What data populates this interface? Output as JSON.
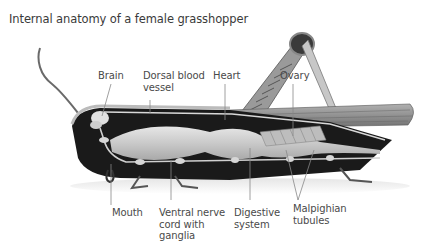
{
  "title": "Internal anatomy of a female grasshopper",
  "labels": {
    "top": [
      {
        "id": "brain",
        "text": "Brain"
      },
      {
        "id": "dorsal_blood_vessel",
        "line1": "Dorsal blood",
        "line2": "vessel"
      },
      {
        "id": "heart",
        "text": "Heart"
      },
      {
        "id": "ovary",
        "text": "Ovary"
      }
    ],
    "bottom": [
      {
        "id": "mouth",
        "text": "Mouth"
      },
      {
        "id": "ventral_nerve_cord",
        "line1": "Ventral nerve",
        "line2": "cord with",
        "line3": "ganglia"
      },
      {
        "id": "digestive_system",
        "line1": "Digestive",
        "line2": "system"
      },
      {
        "id": "malpighian_tubules",
        "line1": "Malpighian",
        "line2": "tubules"
      }
    ]
  },
  "colors": {
    "label_text": "#4a4a4a",
    "leader_line": "#888888",
    "body_dark": "#1a1a1a",
    "organ_light": "#cfcfcf",
    "wing": "#8a8a8a"
  }
}
